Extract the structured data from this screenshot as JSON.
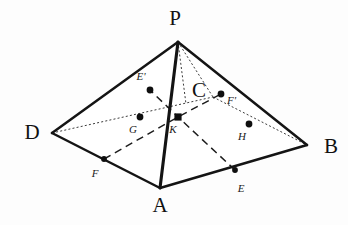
{
  "figure": {
    "background_color": "#fdfdfd",
    "stroke_color": "#141414",
    "hidden_stroke_color": "#3c3c3c",
    "dashed_stroke_color": "#1c1c1c"
  },
  "vertices": {
    "P": {
      "label": "P",
      "x": 178,
      "y": 42,
      "label_x": 175,
      "label_y": 25
    },
    "A": {
      "label": "A",
      "x": 160,
      "y": 188,
      "label_x": 160,
      "label_y": 212
    },
    "B": {
      "label": "B",
      "x": 307,
      "y": 145,
      "label_x": 324,
      "label_y": 153
    },
    "C": {
      "label": "C",
      "x": 213,
      "y": 97,
      "label_x": 206,
      "label_y": 97
    },
    "D": {
      "label": "D",
      "x": 52,
      "y": 133,
      "label_x": 32,
      "label_y": 139
    }
  },
  "points": {
    "E": {
      "label": "E",
      "x": 235,
      "y": 170,
      "label_x": 241,
      "label_y": 192,
      "marker": "dot"
    },
    "F": {
      "label": "F",
      "x": 104,
      "y": 159,
      "label_x": 95,
      "label_y": 177,
      "marker": "dot"
    },
    "E_prime": {
      "label": "E'",
      "x": 150,
      "y": 90,
      "label_x": 141,
      "label_y": 80,
      "marker": "dot"
    },
    "F_prime": {
      "label": "F'",
      "x": 221,
      "y": 94,
      "label_x": 227,
      "label_y": 104,
      "marker": "dot"
    },
    "G": {
      "label": "G",
      "x": 140,
      "y": 117,
      "label_x": 133,
      "label_y": 133,
      "marker": "dot"
    },
    "H": {
      "label": "H",
      "x": 249,
      "y": 124,
      "label_x": 242,
      "label_y": 140,
      "marker": "dot"
    },
    "K": {
      "label": "K",
      "x": 178,
      "y": 117,
      "label_x": 173,
      "label_y": 133,
      "marker": "square"
    }
  },
  "edges": {
    "solid": [
      {
        "name": "edge-P-D",
        "from": "P",
        "to": "D"
      },
      {
        "name": "edge-P-B",
        "from": "P",
        "to": "B"
      },
      {
        "name": "edge-D-A",
        "from": "D",
        "to": "A"
      },
      {
        "name": "edge-A-B",
        "from": "A",
        "to": "B"
      }
    ],
    "solid_thick": [
      {
        "name": "edge-P-A",
        "from": "P",
        "to": "A"
      }
    ],
    "hidden": [
      {
        "name": "edge-P-C",
        "from": "P",
        "to": "C"
      },
      {
        "name": "edge-D-C",
        "from": "D",
        "to": "C"
      },
      {
        "name": "edge-C-B",
        "from": "C",
        "to": "B"
      }
    ],
    "dashed_construction": [
      {
        "name": "segment-F-K-Fprime",
        "points": "F,K,F_prime"
      },
      {
        "name": "segment-E-K-Eprime",
        "points": "E,K,E_prime"
      }
    ]
  },
  "marker_sizes": {
    "dot_radius": 3.4,
    "square_half": 3.6
  }
}
